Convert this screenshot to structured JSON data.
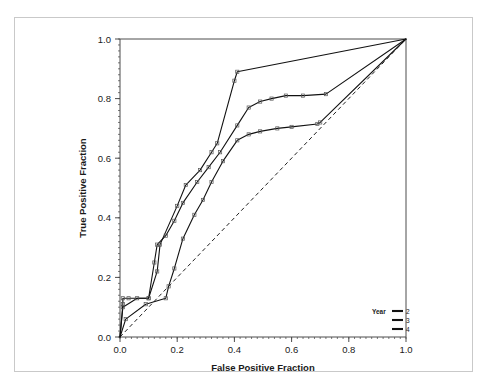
{
  "figure": {
    "frame_color": "#c9c9c9",
    "background": "#ffffff"
  },
  "chart_data": {
    "type": "line",
    "title": "",
    "subtitle": "",
    "xlabel": "False Positive Fraction",
    "ylabel": "True Positive Fraction",
    "xlim": [
      0.0,
      1.0
    ],
    "ylim": [
      0.0,
      1.0
    ],
    "xticks": [
      0.0,
      0.2,
      0.4,
      0.6,
      0.8,
      1.0
    ],
    "yticks": [
      0.0,
      0.2,
      0.4,
      0.6,
      0.8,
      1.0
    ],
    "xticklabels": [
      "0.0",
      "0.2",
      "0.4",
      "0.6",
      "0.8",
      "1.0"
    ],
    "yticklabels": [
      "0.0",
      "0.2",
      "0.4",
      "0.6",
      "0.8",
      "1.0"
    ],
    "grid": false,
    "legend_position": "lower-right",
    "legend_title": "Year",
    "reference_line": {
      "name": "chance-diagonal",
      "style": "dashed",
      "x": [
        0.0,
        1.0
      ],
      "y": [
        0.0,
        1.0
      ]
    },
    "series": [
      {
        "name": "2",
        "label": "2",
        "color": "#111111",
        "x": [
          0.0,
          0.01,
          0.01,
          0.03,
          0.1,
          0.13,
          0.14,
          0.2,
          0.23,
          0.28,
          0.32,
          0.34,
          0.4,
          0.41,
          1.0
        ],
        "y": [
          0.0,
          0.11,
          0.13,
          0.13,
          0.13,
          0.22,
          0.31,
          0.44,
          0.51,
          0.56,
          0.62,
          0.65,
          0.86,
          0.89,
          1.0
        ]
      },
      {
        "name": "3",
        "label": "3",
        "color": "#111111",
        "x": [
          0.0,
          0.01,
          0.06,
          0.1,
          0.12,
          0.13,
          0.16,
          0.19,
          0.22,
          0.27,
          0.31,
          0.35,
          0.41,
          0.45,
          0.49,
          0.53,
          0.58,
          0.64,
          0.72,
          1.0
        ],
        "y": [
          0.0,
          0.1,
          0.13,
          0.13,
          0.25,
          0.31,
          0.34,
          0.39,
          0.45,
          0.52,
          0.57,
          0.62,
          0.71,
          0.77,
          0.79,
          0.8,
          0.81,
          0.81,
          0.815,
          1.0
        ]
      },
      {
        "name": "4",
        "label": "4",
        "color": "#111111",
        "x": [
          0.0,
          0.02,
          0.09,
          0.16,
          0.17,
          0.19,
          0.22,
          0.26,
          0.29,
          0.32,
          0.36,
          0.41,
          0.45,
          0.49,
          0.55,
          0.6,
          0.69,
          0.7,
          1.0
        ],
        "y": [
          0.0,
          0.06,
          0.11,
          0.13,
          0.17,
          0.23,
          0.33,
          0.41,
          0.46,
          0.52,
          0.59,
          0.66,
          0.68,
          0.69,
          0.7,
          0.705,
          0.715,
          0.72,
          1.0
        ]
      }
    ]
  }
}
